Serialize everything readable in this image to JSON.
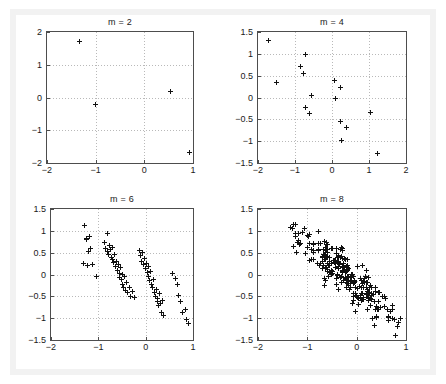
{
  "figure": {
    "background_color": "#ffffff",
    "frame_color": "#f2f2f2",
    "axes_color": "#4d4d4d",
    "grid_color": "#b9b9b9",
    "marker_color": "#111111",
    "marker_symbol": "plus"
  },
  "chart_data": [
    {
      "type": "scatter",
      "title": "m = 2",
      "xlabel": "",
      "ylabel": "",
      "xlim": [
        -2,
        1
      ],
      "ylim": [
        -2,
        2
      ],
      "xticks": [
        -2,
        -1,
        0,
        1
      ],
      "xticklabels": [
        "-2",
        "-1",
        "0",
        "1"
      ],
      "yticks": [
        -2,
        -1,
        0,
        1,
        2
      ],
      "yticklabels": [
        "-2",
        "-1",
        "0",
        "1",
        "2"
      ],
      "grid": true,
      "legend": null,
      "marker": "+",
      "n_points": 4,
      "points": [
        [
          -1.34,
          1.7
        ],
        [
          -1.0,
          -0.22
        ],
        [
          0.53,
          0.19
        ],
        [
          0.93,
          -1.68
        ]
      ]
    },
    {
      "type": "scatter",
      "title": "m = 4",
      "xlabel": "",
      "ylabel": "",
      "xlim": [
        -2,
        2
      ],
      "ylim": [
        -1.5,
        1.5
      ],
      "xticks": [
        -2,
        -1,
        0,
        1,
        2
      ],
      "xticklabels": [
        "-2",
        "-1",
        "0",
        "1",
        "2"
      ],
      "yticks": [
        -1.5,
        -1,
        -0.5,
        0,
        0.5,
        1,
        1.5
      ],
      "yticklabels": [
        "-1.5",
        "-1",
        "-0.5",
        "0",
        "0.5",
        "1",
        "1.5"
      ],
      "grid": true,
      "legend": null,
      "marker": "+",
      "n_points": 16,
      "points": [
        [
          -1.72,
          1.3
        ],
        [
          -1.5,
          0.35
        ],
        [
          -0.86,
          0.7
        ],
        [
          -0.78,
          0.55
        ],
        [
          -0.72,
          0.98
        ],
        [
          -0.72,
          -0.23
        ],
        [
          -0.62,
          -0.36
        ],
        [
          -0.56,
          0.04
        ],
        [
          0.06,
          0.38
        ],
        [
          0.1,
          -0.03
        ],
        [
          0.22,
          0.24
        ],
        [
          0.24,
          -0.55
        ],
        [
          0.26,
          -0.99
        ],
        [
          0.4,
          -0.68
        ],
        [
          1.04,
          -0.34
        ],
        [
          1.22,
          -1.29
        ]
      ]
    },
    {
      "type": "scatter",
      "title": "m = 6",
      "xlabel": "",
      "ylabel": "",
      "xlim": [
        -2,
        1
      ],
      "ylim": [
        -1.5,
        1.5
      ],
      "xticks": [
        -2,
        -1,
        0,
        1
      ],
      "xticklabels": [
        "-2",
        "-1",
        "0",
        "1"
      ],
      "yticks": [
        -1.5,
        -1,
        -0.5,
        0,
        0.5,
        1,
        1.5
      ],
      "yticklabels": [
        "-1.5",
        "-1",
        "-0.5",
        "0",
        "0.5",
        "1",
        "1.5"
      ],
      "grid": true,
      "legend": null,
      "marker": "+",
      "n_points": 64,
      "points": [
        [
          -1.3,
          1.12
        ],
        [
          -1.24,
          0.83
        ],
        [
          -1.2,
          0.52
        ],
        [
          -1.18,
          0.86
        ],
        [
          -1.16,
          0.6
        ],
        [
          -1.26,
          0.8
        ],
        [
          -1.32,
          0.25
        ],
        [
          -1.22,
          0.21
        ],
        [
          -1.12,
          0.24
        ],
        [
          -1.04,
          -0.05
        ],
        [
          -0.88,
          0.74
        ],
        [
          -0.84,
          0.6
        ],
        [
          -0.8,
          0.93
        ],
        [
          -0.8,
          0.52
        ],
        [
          -0.78,
          0.45
        ],
        [
          -0.76,
          0.66
        ],
        [
          -0.74,
          0.58
        ],
        [
          -0.72,
          0.4
        ],
        [
          -0.7,
          0.62
        ],
        [
          -0.7,
          0.34
        ],
        [
          -0.68,
          0.28
        ],
        [
          -0.66,
          0.46
        ],
        [
          -0.64,
          0.18
        ],
        [
          -0.62,
          0.3
        ],
        [
          -0.6,
          0.1
        ],
        [
          -0.58,
          0.22
        ],
        [
          -0.56,
          0.03
        ],
        [
          -0.56,
          -0.06
        ],
        [
          -0.54,
          0.15
        ],
        [
          -0.52,
          -0.12
        ],
        [
          -0.5,
          0.0
        ],
        [
          -0.48,
          -0.22
        ],
        [
          -0.46,
          -0.3
        ],
        [
          -0.44,
          -0.04
        ],
        [
          -0.42,
          -0.36
        ],
        [
          -0.4,
          -0.18
        ],
        [
          -0.38,
          -0.42
        ],
        [
          -0.34,
          -0.3
        ],
        [
          -0.32,
          -0.5
        ],
        [
          -0.28,
          -0.4
        ],
        [
          -0.24,
          -0.52
        ],
        [
          -0.14,
          0.54
        ],
        [
          -0.1,
          0.43
        ],
        [
          -0.08,
          0.3
        ],
        [
          -0.06,
          0.5
        ],
        [
          -0.04,
          0.22
        ],
        [
          -0.02,
          0.36
        ],
        [
          0.0,
          0.14
        ],
        [
          0.02,
          0.26
        ],
        [
          0.04,
          0.05
        ],
        [
          0.06,
          0.18
        ],
        [
          0.06,
          -0.05
        ],
        [
          0.08,
          -0.14
        ],
        [
          0.1,
          0.08
        ],
        [
          0.12,
          -0.22
        ],
        [
          0.14,
          -0.3
        ],
        [
          0.16,
          -0.12
        ],
        [
          0.18,
          -0.42
        ],
        [
          0.2,
          -0.5
        ],
        [
          0.22,
          -0.34
        ],
        [
          0.24,
          -0.62
        ],
        [
          0.26,
          -0.55
        ],
        [
          0.28,
          -0.72
        ],
        [
          0.3,
          -0.44
        ],
        [
          0.32,
          -0.66
        ],
        [
          0.34,
          -0.86
        ],
        [
          0.36,
          -0.6
        ],
        [
          0.38,
          -0.95
        ],
        [
          0.56,
          0.02
        ],
        [
          0.62,
          -0.1
        ],
        [
          0.68,
          -0.24
        ],
        [
          0.7,
          -0.48
        ],
        [
          0.74,
          -0.62
        ],
        [
          0.78,
          -0.86
        ],
        [
          0.84,
          -0.8
        ],
        [
          0.86,
          -1.02
        ],
        [
          0.9,
          -1.12
        ]
      ]
    },
    {
      "type": "scatter",
      "title": "m = 8",
      "xlabel": "",
      "ylabel": "",
      "xlim": [
        -2,
        1
      ],
      "ylim": [
        -1.5,
        1.5
      ],
      "xticks": [
        -2,
        -1,
        0,
        1
      ],
      "xticklabels": [
        "-2",
        "-1",
        "0",
        "1"
      ],
      "yticks": [
        -1.5,
        -1,
        -0.5,
        0,
        0.5,
        1,
        1.5
      ],
      "yticklabels": [
        "-1.5",
        "-1",
        "-0.5",
        "0",
        "0.5",
        "1",
        "1.5"
      ],
      "grid": true,
      "legend": null,
      "marker": "+",
      "n_points": 256,
      "cloud": {
        "description": "dense negatively-correlated elliptical cloud",
        "center": [
          -0.28,
          0.02
        ],
        "slope": -0.95,
        "x_spread": 0.52,
        "residual_spread": 0.22,
        "seed": 20250607,
        "outliers": [
          [
            -1.28,
            1.14
          ],
          [
            -0.78,
            0.99
          ],
          [
            0.32,
            -1.0
          ],
          [
            0.82,
            -1.18
          ],
          [
            -1.18,
            0.94
          ],
          [
            -1.22,
            0.5
          ]
        ]
      }
    }
  ]
}
